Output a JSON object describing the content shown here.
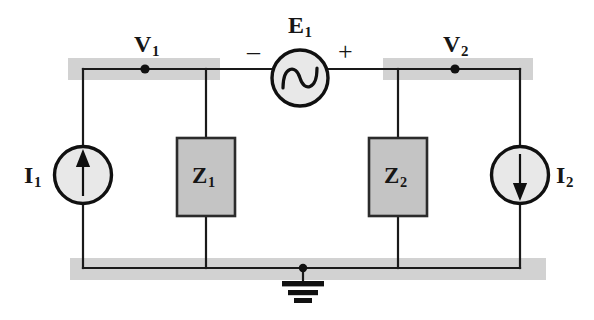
{
  "figure": {
    "kind": "electrical-circuit-schematic",
    "background_color": "#ffffff",
    "wire_color": "#1a1a1a",
    "highlight_color": "#d2d2d2",
    "box_fill_color": "#c4c4c4",
    "box_border_color": "#2b2b2b",
    "source_fill_color": "#e8e8e8"
  },
  "labels": {
    "v1": {
      "symbol": "V",
      "subscript": "1"
    },
    "v2": {
      "symbol": "V",
      "subscript": "2"
    },
    "e1": {
      "symbol": "E",
      "subscript": "1"
    },
    "i1": {
      "symbol": "I",
      "subscript": "1"
    },
    "i2": {
      "symbol": "I",
      "subscript": "2"
    },
    "z1": {
      "symbol": "Z",
      "subscript": "1"
    },
    "z2": {
      "symbol": "Z",
      "subscript": "2"
    },
    "polarity_minus": "–",
    "polarity_plus": "+"
  },
  "components": [
    {
      "id": "i1",
      "type": "current-source",
      "name": "current-source-i1",
      "label": "I1",
      "arrow_direction": "up",
      "shape": "circle"
    },
    {
      "id": "z1",
      "type": "impedance",
      "name": "impedance-z1",
      "label": "Z1",
      "shape": "rectangle"
    },
    {
      "id": "e1",
      "type": "ac-voltage-source",
      "name": "ac-voltage-source-e1",
      "label": "E1",
      "shape": "circle-with-sine",
      "terminal_left": "–",
      "terminal_right": "+"
    },
    {
      "id": "z2",
      "type": "impedance",
      "name": "impedance-z2",
      "label": "Z2",
      "shape": "rectangle"
    },
    {
      "id": "i2",
      "type": "current-source",
      "name": "current-source-i2",
      "label": "I2",
      "arrow_direction": "down",
      "shape": "circle"
    },
    {
      "id": "gnd",
      "type": "ground",
      "name": "ground-symbol",
      "label": "",
      "shape": "three-bar-earth"
    }
  ],
  "nodes": [
    {
      "id": "n_v1",
      "name": "node-v1",
      "label": "V1",
      "highlighted": true
    },
    {
      "id": "n_v2",
      "name": "node-v2",
      "label": "V2",
      "highlighted": true
    },
    {
      "id": "n_gnd",
      "name": "node-ground",
      "label": "",
      "highlighted": true
    }
  ]
}
